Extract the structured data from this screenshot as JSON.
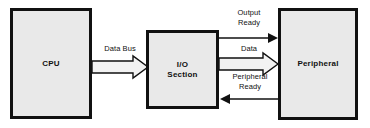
{
  "diagram": {
    "background_color": "#ffffff",
    "box_fill_color": "#e9e9e9",
    "line_color": "#111111",
    "blocks": [
      {
        "id": "cpu",
        "label": "CPU"
      },
      {
        "id": "io",
        "label": "I/O\nSection"
      },
      {
        "id": "peripheral",
        "label": "Peripheral"
      }
    ],
    "connections": [
      {
        "id": "data-bus",
        "label": "Data Bus",
        "style": "block-arrow",
        "direction": "right",
        "from": "cpu",
        "to": "io"
      },
      {
        "id": "output-ready",
        "label": "Output\nReady",
        "style": "line-arrow",
        "direction": "right",
        "from": "io",
        "to": "peripheral"
      },
      {
        "id": "data",
        "label": "Data",
        "style": "block-arrow",
        "direction": "right",
        "from": "io",
        "to": "peripheral"
      },
      {
        "id": "peripheral-ready",
        "label": "Peripheral\nReady",
        "style": "line-arrow",
        "direction": "left",
        "from": "peripheral",
        "to": "io"
      }
    ]
  }
}
